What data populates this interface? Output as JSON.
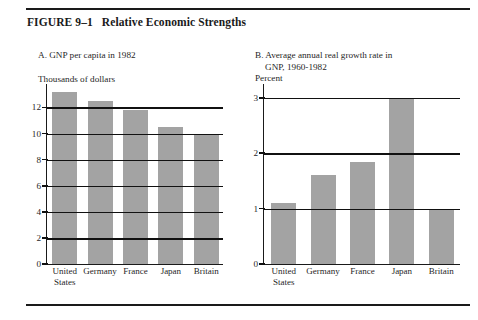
{
  "figure": {
    "number": "FIGURE 9–1",
    "title": "Relative Economic Strengths"
  },
  "panels": [
    {
      "id": "a",
      "title": "A. GNP per capita in 1982",
      "title_line2": "",
      "units": "Thousands of dollars"
    },
    {
      "id": "b",
      "title": "B. Average annual real growth rate in",
      "title_line2": "GNP, 1960-1982",
      "units": "Percent"
    }
  ],
  "chart_data": [
    {
      "type": "bar",
      "title": "A. GNP per capita in 1982",
      "xlabel": "",
      "ylabel": "Thousands of dollars",
      "categories": [
        "United States",
        "Germany",
        "France",
        "Japan",
        "Britain"
      ],
      "category_lines": [
        [
          "United",
          "States"
        ],
        [
          "Germany"
        ],
        [
          "France"
        ],
        [
          "Japan"
        ],
        [
          "Britain"
        ]
      ],
      "values": [
        13.2,
        12.5,
        11.8,
        10.5,
        10.0
      ],
      "ylim": [
        0,
        13.8
      ],
      "yticks": [
        12,
        10,
        8,
        6,
        4,
        2,
        0
      ],
      "gridlines": [
        12,
        10,
        8,
        6,
        4,
        2
      ],
      "grid": true,
      "legend": "none",
      "bar_color": "#a3a3a3"
    },
    {
      "type": "bar",
      "title": "B. Average annual real growth rate in GNP, 1960-1982",
      "xlabel": "",
      "ylabel": "Percent",
      "categories": [
        "United States",
        "Germany",
        "France",
        "Japan",
        "Britain"
      ],
      "category_lines": [
        [
          "United",
          "States"
        ],
        [
          "Germany"
        ],
        [
          "France"
        ],
        [
          "Japan"
        ],
        [
          "Britain"
        ]
      ],
      "values": [
        1.1,
        1.6,
        1.85,
        3.0,
        0.97
      ],
      "ylim": [
        0,
        3.25
      ],
      "yticks": [
        3,
        2,
        1,
        0
      ],
      "gridlines": [
        3,
        2,
        1
      ],
      "grid": true,
      "legend": "none",
      "bar_color": "#a3a3a3"
    }
  ]
}
